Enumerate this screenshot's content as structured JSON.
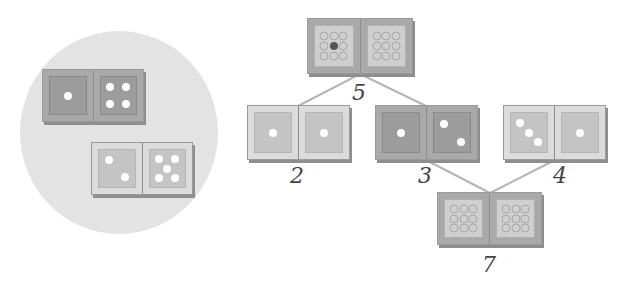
{
  "left_panel": {
    "dominoes": [
      {
        "id": "1-4",
        "shade": "dark",
        "left": 1,
        "right": 4
      },
      {
        "id": "2-5",
        "shade": "light",
        "left": 2,
        "right": 5
      }
    ]
  },
  "tree": {
    "top": {
      "shade": "mystery",
      "label": "5",
      "visible_pip_left": 1
    },
    "children": [
      {
        "shade": "light",
        "left": 1,
        "right": 1,
        "label": "2"
      },
      {
        "shade": "dark",
        "left": 1,
        "right": 2,
        "label": "3"
      },
      {
        "shade": "light",
        "left": 3,
        "right": 1,
        "label": "4"
      }
    ],
    "bottom": {
      "shade": "mystery",
      "label": "7"
    }
  },
  "colors": {
    "circle": "#e3e3e3",
    "dark_domino": "#a9a9a9",
    "light_domino": "#dcdcdc",
    "pip": "#ffffff",
    "line": "#b5b5b5"
  }
}
